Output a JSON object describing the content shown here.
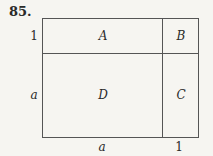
{
  "problem_number": "85.",
  "regions": {
    "A": "A",
    "B": "B",
    "C": "C",
    "D": "D"
  },
  "side_labels": {
    "left_top": "1",
    "left_bottom": "a",
    "bottom_left": "a",
    "bottom_right": "1"
  }
}
